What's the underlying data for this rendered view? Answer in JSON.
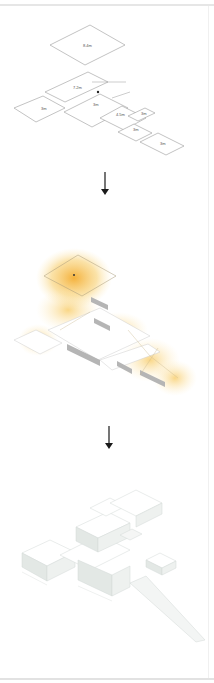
{
  "diagram": {
    "stages": [
      {
        "id": "plan",
        "name": "Floor plan with ceiling heights",
        "labels": [
          {
            "text": "8.4m",
            "x": 87,
            "y": 47
          },
          {
            "text": "7.2m",
            "x": 76,
            "y": 89
          },
          {
            "text": "3m",
            "x": 43,
            "y": 110
          },
          {
            "text": "3m",
            "x": 96,
            "y": 106
          },
          {
            "text": "4.5m",
            "x": 120,
            "y": 114
          },
          {
            "text": "3m",
            "x": 143,
            "y": 114
          },
          {
            "text": "3m",
            "x": 135,
            "y": 130
          },
          {
            "text": "3m",
            "x": 162,
            "y": 143
          }
        ]
      },
      {
        "id": "light",
        "name": "Daylight / light distribution analysis",
        "colors": {
          "glow": "#f5b942",
          "glow_light": "#fbe3a6",
          "wall": "#a8a8a8"
        }
      },
      {
        "id": "massing",
        "name": "Volumetric massing model",
        "colors": {
          "top": "#ffffff",
          "side": "#e4e8e6",
          "edge": "#cfd5d2"
        }
      }
    ],
    "arrows": [
      {
        "icon": "arrow-down-icon",
        "x": 105,
        "y": 172
      },
      {
        "icon": "arrow-down-icon",
        "x": 109,
        "y": 425
      }
    ],
    "colors": {
      "line": "#9a9a9a",
      "arrow": "#1a1a1a",
      "border": "#e6e6e6"
    }
  }
}
